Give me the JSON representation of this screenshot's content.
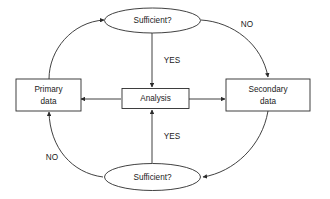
{
  "diagram": {
    "background_color": "#ffffff",
    "stroke_color": "#2b2b2b",
    "text_color": "#1a1a1a",
    "nodes": {
      "top_decision": {
        "shape": "ellipse",
        "label": "Sufficient?"
      },
      "bottom_decision": {
        "shape": "ellipse",
        "label": "Sufficient?"
      },
      "primary": {
        "shape": "rect",
        "label_line1": "Primary",
        "label_line2": "data"
      },
      "secondary": {
        "shape": "rect",
        "label_line1": "Secondary",
        "label_line2": "data"
      },
      "analysis": {
        "shape": "rect",
        "label": "Analysis"
      }
    },
    "edge_labels": {
      "top_no": "NO",
      "bottom_no": "NO",
      "top_yes": "YES",
      "bottom_yes": "YES"
    }
  }
}
